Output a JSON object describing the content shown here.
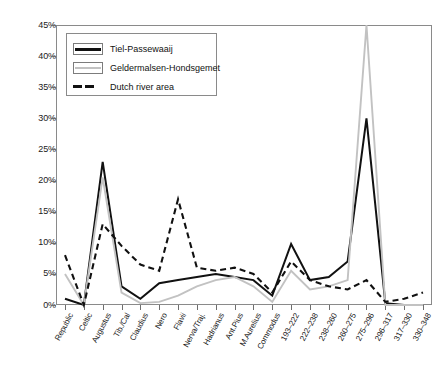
{
  "chart_data": {
    "type": "line",
    "title": "",
    "xlabel": "",
    "ylabel": "",
    "ylim": [
      0,
      45
    ],
    "ytick_labels": [
      "0%",
      "5%",
      "10%",
      "15%",
      "20%",
      "25%",
      "30%",
      "35%",
      "40%",
      "45%"
    ],
    "ytick_values": [
      0,
      5,
      10,
      15,
      20,
      25,
      30,
      35,
      40,
      45
    ],
    "grid": false,
    "legend_position": "upper-left-inside",
    "categories": [
      "Republic",
      "Celtic",
      "Augustus",
      "Tib./Cal",
      "Claudius",
      "Nero",
      "Flavii",
      "Nerva/Traj.",
      "Hadrianus",
      "Ant.Pius",
      "M.Aurelius",
      "Commodus",
      "193–222",
      "222–238",
      "238–260",
      "260–275",
      "275–296",
      "296–317",
      "317–330",
      "330–348"
    ],
    "series": [
      {
        "name": "Tiel-Passewaaij",
        "style": "solid",
        "color": "#111111",
        "values": [
          1.0,
          0.0,
          23.0,
          3.0,
          1.0,
          3.5,
          4.0,
          4.5,
          5.0,
          4.5,
          4.0,
          1.5,
          9.8,
          4.0,
          4.5,
          7.0,
          30.0,
          0.3,
          0.0,
          0.0
        ]
      },
      {
        "name": "Geldermalsen-Hondsgemet",
        "style": "solid",
        "color": "#c2c2c2",
        "values": [
          5.0,
          0.0,
          20.5,
          2.0,
          0.3,
          0.5,
          1.5,
          3.0,
          4.0,
          4.5,
          3.0,
          0.5,
          5.5,
          2.5,
          3.0,
          4.0,
          45.0,
          0.0,
          0.0,
          0.0
        ]
      },
      {
        "name": "Dutch river area",
        "style": "dashed",
        "color": "#111111",
        "values": [
          8.0,
          0.0,
          13.0,
          9.5,
          6.5,
          5.5,
          17.0,
          6.0,
          5.5,
          6.0,
          5.0,
          2.0,
          7.0,
          4.0,
          3.0,
          2.5,
          4.0,
          0.5,
          1.0,
          2.0
        ]
      }
    ]
  },
  "legend": {
    "entries": [
      {
        "label": "Tiel-Passewaaij",
        "swatch": "solid-black-line-swatch"
      },
      {
        "label": "Geldermalsen-Hondsgemet",
        "swatch": "solid-gray-line-swatch"
      },
      {
        "label": "Dutch river area",
        "swatch": "dashed-black-line-swatch"
      }
    ]
  }
}
